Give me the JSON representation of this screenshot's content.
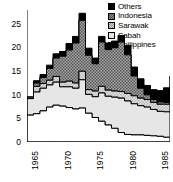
{
  "chart_data": {
    "type": "area",
    "title": "",
    "subtitle": "",
    "xlabel": "",
    "ylabel": "",
    "stacked": true,
    "grid": false,
    "legend_position": "top-right",
    "xlim": [
      1965,
      1987
    ],
    "ylim": [
      0,
      28
    ],
    "x": [
      1965,
      1966,
      1967,
      1968,
      1969,
      1970,
      1971,
      1972,
      1973,
      1974,
      1975,
      1976,
      1977,
      1978,
      1979,
      1980,
      1981,
      1982,
      1983,
      1984,
      1985,
      1986,
      1987
    ],
    "xticks": [
      1965,
      1970,
      1975,
      1980,
      1985,
      1987
    ],
    "xticklabels": [
      "1965",
      "1970",
      "1975",
      "1980",
      "1985",
      "1987"
    ],
    "yticks": [
      0,
      5,
      10,
      15,
      20,
      25
    ],
    "yticklabels": [
      "0",
      "5",
      "10",
      "15",
      "20",
      "25"
    ],
    "series": [
      {
        "name": "Philippines",
        "fill": "white",
        "values": [
          5.7,
          6.0,
          6.6,
          7.4,
          7.8,
          7.6,
          7.3,
          7.0,
          7.2,
          6.1,
          5.2,
          4.4,
          3.6,
          2.9,
          2.0,
          1.6,
          1.5,
          1.5,
          1.4,
          1.3,
          1.2,
          1.0,
          0.9
        ]
      },
      {
        "name": "Sabah",
        "fill": "light-gray",
        "values": [
          3.5,
          4.6,
          4.8,
          4.7,
          4.9,
          4.1,
          4.4,
          4.4,
          6.0,
          4.0,
          4.4,
          6.0,
          6.1,
          6.6,
          7.3,
          7.1,
          6.6,
          6.2,
          6.0,
          5.6,
          5.3,
          5.4,
          5.5
        ]
      },
      {
        "name": "Sarawak",
        "fill": "gray-hatch",
        "values": [
          0.3,
          1.2,
          1.0,
          1.0,
          1.2,
          1.0,
          1.2,
          1.1,
          1.8,
          1.0,
          1.2,
          1.4,
          1.3,
          1.3,
          1.4,
          1.6,
          1.7,
          1.6,
          1.6,
          1.5,
          1.5,
          1.6,
          1.6
        ]
      },
      {
        "name": "Indonesia",
        "fill": "dark-gray-hatch",
        "values": [
          0.0,
          0.7,
          1.3,
          2.5,
          3.9,
          5.5,
          6.6,
          8.5,
          10.8,
          7.3,
          5.8,
          9.4,
          8.6,
          9.2,
          10.5,
          8.2,
          4.2,
          2.1,
          1.0,
          0.6,
          0.5,
          0.4,
          0.4
        ]
      },
      {
        "name": "Others",
        "fill": "black",
        "values": [
          0.0,
          0.5,
          0.6,
          0.7,
          0.9,
          1.0,
          1.4,
          1.4,
          1.5,
          1.5,
          1.2,
          1.2,
          1.4,
          1.4,
          1.4,
          2.0,
          1.9,
          2.0,
          2.0,
          2.1,
          2.4,
          3.1,
          5.6
        ]
      }
    ],
    "totals": [
      9.5,
      13.0,
      14.3,
      16.3,
      18.7,
      19.2,
      20.9,
      22.4,
      27.3,
      19.9,
      17.8,
      22.4,
      21.0,
      21.4,
      22.6,
      20.5,
      15.9,
      13.4,
      12.0,
      11.1,
      10.9,
      11.5,
      14.0
    ]
  },
  "legend": {
    "items": [
      {
        "label": "Others",
        "swatch": "p-others"
      },
      {
        "label": "Indonesia",
        "swatch": "p-indonesia"
      },
      {
        "label": "Sarawak",
        "swatch": "p-sarawak"
      },
      {
        "label": "Sabah",
        "swatch": "p-sabah"
      },
      {
        "label": "Philippines",
        "swatch": "p-philippines"
      }
    ]
  },
  "colors": {
    "others": "#000000",
    "indonesia": "#8e8e8e",
    "sarawak": "#d0d0d0",
    "sabah": "#e3e3e3",
    "philippines": "#ffffff",
    "axis": "#000000",
    "background": "#ffffff"
  }
}
